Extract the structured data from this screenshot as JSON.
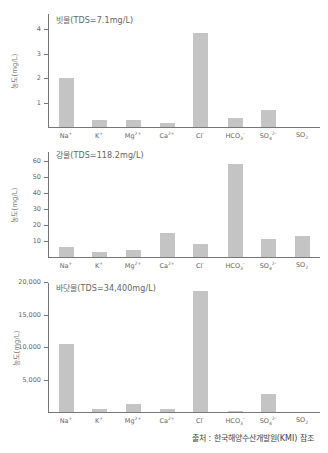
{
  "chart_data": [
    {
      "type": "bar",
      "title": "빗물(TDS=7.1mg/L)",
      "ylabel": "농도(mg/L)",
      "xlabel": "",
      "categories": [
        "Na⁺",
        "K⁺",
        "Mg²⁺",
        "Ca²⁺",
        "Cl⁻",
        "HCO₃⁻",
        "SO₄²⁻",
        "SO₂"
      ],
      "values": [
        2.0,
        0.3,
        0.3,
        0.15,
        3.85,
        0.35,
        0.7,
        0
      ],
      "yticks": [
        "1",
        "2",
        "3",
        "4"
      ],
      "ylim": [
        0,
        4.2
      ],
      "grid": false
    },
    {
      "type": "bar",
      "title": "강물(TDS=118.2mg/L)",
      "ylabel": "농도(mg/L)",
      "xlabel": "",
      "categories": [
        "Na⁺",
        "K⁺",
        "Mg²⁺",
        "Ca²⁺",
        "Cl⁻",
        "HCO₃⁻",
        "SO₄²⁻",
        "SO₂"
      ],
      "values": [
        6,
        3,
        4.5,
        15,
        8,
        58,
        11,
        13
      ],
      "yticks": [
        "10",
        "20",
        "30",
        "40",
        "50",
        "60"
      ],
      "ylim": [
        0,
        63
      ],
      "grid": false
    },
    {
      "type": "bar",
      "title": "바닷물(TDS=34,400mg/L)",
      "ylabel": "농도(mg/L)",
      "xlabel": "",
      "categories": [
        "Na⁺",
        "K⁺",
        "Mg²⁺",
        "Ca²⁺",
        "Cl⁻",
        "HCO₃⁻",
        "SO₄²⁻",
        "SO₂"
      ],
      "values": [
        10400,
        400,
        1300,
        400,
        18600,
        150,
        2700,
        0
      ],
      "yticks": [
        "5,000",
        "10,000",
        "15,000",
        "20,000"
      ],
      "ylim": [
        0,
        20000
      ],
      "grid": false
    }
  ],
  "labels": {
    "cat": [
      {
        "base": "Na",
        "sup": "+",
        "sub": ""
      },
      {
        "base": "K",
        "sup": "+",
        "sub": ""
      },
      {
        "base": "Mg",
        "sup": "2+",
        "sub": ""
      },
      {
        "base": "Ca",
        "sup": "2+",
        "sub": ""
      },
      {
        "base": "Cl",
        "sup": "-",
        "sub": ""
      },
      {
        "base": "HCO",
        "sup": "-",
        "sub": "3"
      },
      {
        "base": "SO",
        "sup": "2-",
        "sub": "4"
      },
      {
        "base": "SO",
        "sup": "",
        "sub": "2"
      }
    ]
  },
  "footer": {
    "source": "출처 : 한국해양수산개발원(KMI) 참조"
  },
  "colors": {
    "bar": "#c4c4c4",
    "axis": "#777777"
  }
}
